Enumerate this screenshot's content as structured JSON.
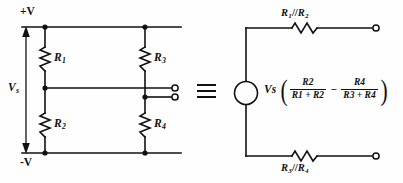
{
  "figure": {
    "type": "circuit-diagram",
    "background_color": "#fefefe",
    "line_color": "#111111"
  },
  "left_circuit": {
    "name": "wheatstone-bridge",
    "rails": {
      "top_label": "+V",
      "bottom_label": "-V"
    },
    "source_label": {
      "base": "V",
      "sub": "s"
    },
    "resistors": [
      {
        "id": "R1",
        "base": "R",
        "sub": "1"
      },
      {
        "id": "R2",
        "base": "R",
        "sub": "2"
      },
      {
        "id": "R3",
        "base": "R",
        "sub": "3"
      },
      {
        "id": "R4",
        "base": "R",
        "sub": "4"
      }
    ],
    "output_terminals": 2
  },
  "equivalence_symbol": "≡",
  "right_circuit": {
    "name": "thevenin-equivalent",
    "top_resistor": {
      "base_a": "R",
      "sub_a": "1",
      "sep": "//",
      "base_b": "R",
      "sub_b": "2"
    },
    "bottom_resistor": {
      "base_a": "R",
      "sub_a": "3",
      "sep": "//",
      "base_b": "R",
      "sub_b": "4"
    },
    "source": {
      "shape": "circle",
      "label_base": "V",
      "label_sub": "s"
    },
    "formula": {
      "prefix_base": "V",
      "prefix_sub": "s",
      "open_paren": "(",
      "term1": {
        "num_base": "R",
        "num_sub": "2",
        "den": "R₁ + R₂",
        "den_base_a": "R",
        "den_sub_a": "1",
        "den_plus": " + ",
        "den_base_b": "R",
        "den_sub_b": "2"
      },
      "operator": "−",
      "term2": {
        "num_base": "R",
        "num_sub": "4",
        "den": "R₃ + R₄",
        "den_base_a": "R",
        "den_sub_a": "3",
        "den_plus": " + ",
        "den_base_b": "R",
        "den_sub_b": "4"
      },
      "close_paren": ")"
    },
    "output_terminals": 2
  }
}
